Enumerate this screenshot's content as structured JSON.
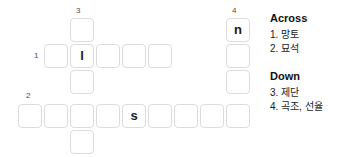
{
  "puzzle": {
    "type": "crossword",
    "cell_size": 26,
    "grid_origin": {
      "x": 18,
      "y": 18
    },
    "entries": [
      {
        "id": "across-1",
        "number": "1",
        "direction": "across",
        "length": 5,
        "start": {
          "col": 1,
          "row": 1
        },
        "number_label_pos": {
          "x": 35,
          "y": 53
        },
        "letters": [
          "",
          "l",
          "",
          "",
          ""
        ]
      },
      {
        "id": "across-2",
        "number": "2",
        "direction": "across",
        "length": 9,
        "start": {
          "col": 0,
          "row": 3
        },
        "number_label_pos": {
          "x": 26,
          "y": 92
        },
        "letters": [
          "",
          "",
          "",
          "",
          "s",
          "",
          "",
          "",
          ""
        ]
      },
      {
        "id": "down-3",
        "number": "3",
        "direction": "down",
        "length": 5,
        "start": {
          "col": 2,
          "row": 0
        },
        "number_label_pos": {
          "x": 76,
          "y": 10
        },
        "letters": [
          "",
          "l",
          "",
          "",
          ""
        ]
      },
      {
        "id": "down-4",
        "number": "4",
        "direction": "down",
        "length": 4,
        "start": {
          "col": 8,
          "row": 0
        },
        "number_label_pos": {
          "x": 228,
          "y": 10
        },
        "letters": [
          "n",
          "",
          "",
          ""
        ]
      }
    ],
    "cells": [
      {
        "name": "cell-r0c2",
        "x": 70,
        "y": 18,
        "letter": ""
      },
      {
        "name": "cell-r1c1",
        "x": 44,
        "y": 44,
        "letter": ""
      },
      {
        "name": "cell-r1c2",
        "x": 70,
        "y": 44,
        "letter": "l"
      },
      {
        "name": "cell-r1c3",
        "x": 96,
        "y": 44,
        "letter": ""
      },
      {
        "name": "cell-r1c4",
        "x": 122,
        "y": 44,
        "letter": ""
      },
      {
        "name": "cell-r1c5",
        "x": 148,
        "y": 44,
        "letter": ""
      },
      {
        "name": "cell-r2c2",
        "x": 70,
        "y": 70,
        "letter": ""
      },
      {
        "name": "cell-r3c0",
        "x": 18,
        "y": 104,
        "letter": ""
      },
      {
        "name": "cell-r3c1",
        "x": 44,
        "y": 104,
        "letter": ""
      },
      {
        "name": "cell-r3c2",
        "x": 70,
        "y": 104,
        "letter": ""
      },
      {
        "name": "cell-r3c3",
        "x": 96,
        "y": 104,
        "letter": ""
      },
      {
        "name": "cell-r3c4",
        "x": 122,
        "y": 104,
        "letter": "s"
      },
      {
        "name": "cell-r3c5",
        "x": 148,
        "y": 104,
        "letter": ""
      },
      {
        "name": "cell-r3c6",
        "x": 174,
        "y": 104,
        "letter": ""
      },
      {
        "name": "cell-r3c7",
        "x": 200,
        "y": 104,
        "letter": ""
      },
      {
        "name": "cell-r3c8",
        "x": 226,
        "y": 104,
        "letter": ""
      },
      {
        "name": "cell-r4c2",
        "x": 70,
        "y": 130,
        "letter": ""
      },
      {
        "name": "cell-r0c8",
        "x": 226,
        "y": 18,
        "letter": "n"
      },
      {
        "name": "cell-r1c8",
        "x": 226,
        "y": 44,
        "letter": ""
      },
      {
        "name": "cell-r2c8",
        "x": 226,
        "y": 70,
        "letter": ""
      }
    ],
    "numbers": [
      {
        "name": "clue-number-3",
        "label": "3",
        "x": 76,
        "y": 8
      },
      {
        "name": "clue-number-4",
        "label": "4",
        "x": 232,
        "y": 8
      },
      {
        "name": "clue-number-1",
        "label": "1",
        "x": 34,
        "y": 52
      },
      {
        "name": "clue-number-2",
        "label": "2",
        "x": 26,
        "y": 92
      }
    ]
  },
  "clues": {
    "across": {
      "heading": "Across",
      "items": [
        {
          "number": "1.",
          "text": "망토",
          "full": "1. 망토"
        },
        {
          "number": "2.",
          "text": "묘석",
          "full": "2. 묘석"
        }
      ]
    },
    "down": {
      "heading": "Down",
      "items": [
        {
          "number": "3.",
          "text": "제단",
          "full": "3. 제단"
        },
        {
          "number": "4.",
          "text": "곡조, 선율",
          "full": "4. 곡조, 선율"
        }
      ]
    }
  },
  "colors": {
    "background": "#ffffff",
    "cell_border": "#dcdcdc",
    "letter": "#1a1a1a",
    "clue_number": "#4d4d4d",
    "heading": "#111111",
    "clue_text": "#1a1a1a"
  }
}
